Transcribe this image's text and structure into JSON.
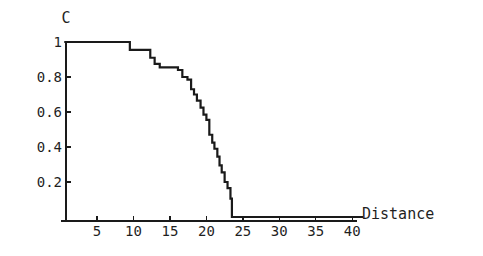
{
  "chart_data": {
    "type": "line",
    "title": "",
    "subtitle": "",
    "xlabel": "Distance",
    "ylabel": "C",
    "xlim": [
      0,
      41.5
    ],
    "ylim": [
      0,
      1.06
    ],
    "grid": false,
    "legend": null,
    "step_style": "post",
    "line_color": "#1a1a1a",
    "line_width": 2.2,
    "xticks": [
      5,
      10,
      15,
      20,
      25,
      30,
      35,
      40
    ],
    "xtick_labels": [
      "5",
      "10",
      "15",
      "20",
      "25",
      "30",
      "35",
      "40"
    ],
    "yticks": [
      0.2,
      0.4,
      0.6,
      0.8,
      1
    ],
    "ytick_labels": [
      "0.2",
      "0.4",
      "0.6",
      "0.8",
      "1"
    ],
    "x": [
      0.5,
      8.6,
      9.5,
      11.0,
      12.3,
      12.9,
      13.6,
      15.1,
      16.1,
      16.7,
      17.4,
      17.9,
      18.3,
      18.7,
      19.2,
      19.6,
      20.0,
      20.4,
      20.8,
      21.1,
      21.5,
      21.8,
      22.1,
      22.5,
      22.9,
      23.3,
      23.5,
      41.5
    ],
    "y": [
      1.0,
      1.0,
      0.955,
      0.955,
      0.91,
      0.875,
      0.855,
      0.855,
      0.84,
      0.8,
      0.785,
      0.73,
      0.7,
      0.665,
      0.625,
      0.585,
      0.555,
      0.47,
      0.425,
      0.39,
      0.345,
      0.295,
      0.255,
      0.2,
      0.165,
      0.105,
      0.0,
      0.0
    ],
    "annotations": []
  },
  "axes": {
    "x_name": "Distance",
    "y_name": "C"
  }
}
